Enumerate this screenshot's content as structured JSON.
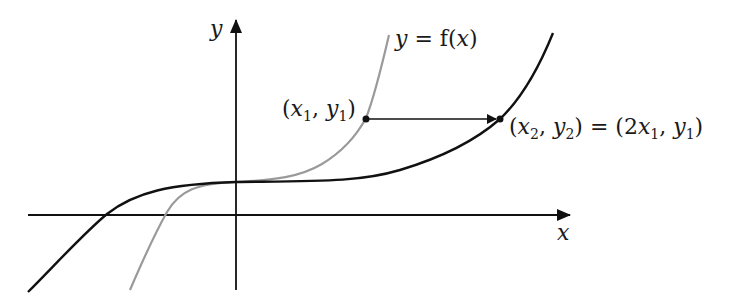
{
  "diagram": {
    "type": "function-transformation",
    "axes": {
      "x_label": "x",
      "y_label": "y"
    },
    "curves": [
      {
        "id": "original",
        "label": "y = f(x)",
        "color": "#9a9a9a",
        "description": "original cubic-like curve f(x)"
      },
      {
        "id": "stretched",
        "label": "",
        "color": "#111111",
        "description": "horizontally stretched curve y = f(x/2)"
      }
    ],
    "points": {
      "p1": {
        "label_open": "(",
        "x": "x",
        "x_sub": "1",
        "comma": ", ",
        "y": "y",
        "y_sub": "1",
        "label_close": ")"
      },
      "p2": {
        "label_open": "(",
        "x": "x",
        "x_sub": "2",
        "comma": ", ",
        "y": "y",
        "y_sub": "2",
        "label_close": ")"
      },
      "equals": " = ",
      "p2_value": {
        "open": "(",
        "coef": "2",
        "x": "x",
        "x_sub": "1",
        "comma": ", ",
        "y": "y",
        "y_sub": "1",
        "close": ")"
      }
    },
    "curve_label": {
      "y": "y",
      "eq": " = f(",
      "x": "x",
      "close": ")"
    }
  }
}
